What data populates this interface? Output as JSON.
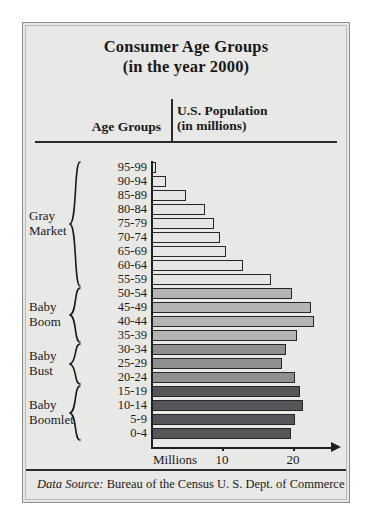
{
  "figure": {
    "title_line1": "Consumer Age Groups",
    "title_line2": "(in the year 2000)",
    "header_left": "Age Groups",
    "header_right_line1": "U.S. Population",
    "header_right_line2": "(in millions)",
    "footer_label": "Data Source:",
    "footer_text": " Bureau of the Census U. S. Dept. of Commerce"
  },
  "colors": {
    "page_background": "#ffffff",
    "figure_background": "#e8e8e6",
    "figure_border": "#8b8b8b",
    "ink": "#1a1a1a",
    "gray_market_bar": "#e6e6e4",
    "baby_boom_bar": "#b4b4b2",
    "baby_bust_bar": "#8f8f8d",
    "baby_boomlet_bar": "#55555a"
  },
  "chart_data": {
    "type": "bar",
    "orientation": "horizontal",
    "title": "Consumer Age Groups (in the year 2000)",
    "xlabel": "Millions",
    "ylabel": "Age Groups",
    "xlim": [
      0,
      25
    ],
    "xticks": [
      10,
      20
    ],
    "xticklabels": [
      "10",
      "20"
    ],
    "grid": false,
    "legend": "none",
    "unit_label": "Millions",
    "categories": [
      "95-99",
      "90-94",
      "85-89",
      "80-84",
      "75-79",
      "70-74",
      "65-69",
      "60-64",
      "55-59",
      "50-54",
      "45-49",
      "40-44",
      "35-39",
      "30-34",
      "25-29",
      "20-24",
      "15-19",
      "10-14",
      "5-9",
      "0-4"
    ],
    "values": [
      0.6,
      2.0,
      4.8,
      7.5,
      8.7,
      9.6,
      10.4,
      12.8,
      16.8,
      19.7,
      22.4,
      22.8,
      20.4,
      18.9,
      18.3,
      20.1,
      20.8,
      21.2,
      20.1,
      19.6
    ],
    "series": [
      {
        "name": "U.S. Population (in millions)",
        "values": [
          0.6,
          2.0,
          4.8,
          7.5,
          8.7,
          9.6,
          10.4,
          12.8,
          16.8,
          19.7,
          22.4,
          22.8,
          20.4,
          18.9,
          18.3,
          20.1,
          20.8,
          21.2,
          20.1,
          19.6
        ]
      }
    ],
    "groups": [
      {
        "label_line1": "Gray",
        "label_line2": "Market",
        "from": "95-99",
        "to": "55-59",
        "start_index": 0,
        "end_index": 8,
        "color": "#e6e6e4"
      },
      {
        "label_line1": "Baby",
        "label_line2": "Boom",
        "from": "50-54",
        "to": "35-39",
        "start_index": 9,
        "end_index": 12,
        "color": "#b4b4b2"
      },
      {
        "label_line1": "Baby",
        "label_line2": "Bust",
        "from": "30-34",
        "to": "20-24",
        "start_index": 13,
        "end_index": 15,
        "color": "#8f8f8d"
      },
      {
        "label_line1": "Baby",
        "label_line2": "Boomlet",
        "from": "15-19",
        "to": "0-4",
        "start_index": 16,
        "end_index": 19,
        "color": "#55555a"
      }
    ]
  }
}
